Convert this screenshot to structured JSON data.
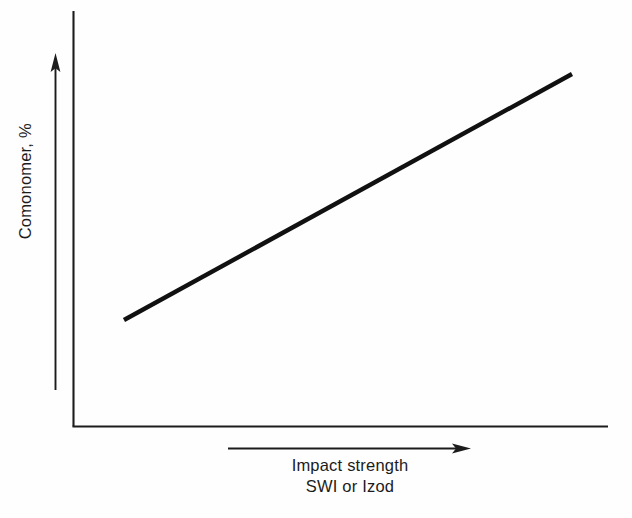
{
  "figure": {
    "background_color": "#fefefe",
    "ink_color": "#1c1c1c",
    "data_line_color": "#111111"
  },
  "axes": {
    "y_axis": {
      "label": "Comonomer, %",
      "arrow_direction": "up",
      "arrow_name": "y-axis-direction-arrow"
    },
    "x_axis": {
      "label_line1": "Impact strength",
      "label_line2": "SWI or Izod",
      "arrow_direction": "right",
      "arrow_name": "x-axis-direction-arrow"
    }
  },
  "chart_data": {
    "type": "line",
    "title": "",
    "subtitle": "",
    "xlabel": "Impact strength SWI or Izod",
    "ylabel": "Comonomer, %",
    "grid": false,
    "legend": null,
    "axis_ticks": {
      "x": [],
      "y": []
    },
    "xlim": [
      0,
      1
    ],
    "ylim": [
      0,
      1
    ],
    "annotations": [
      "Comonomer, %",
      "Impact strength",
      "SWI or Izod"
    ],
    "series": [
      {
        "name": "Comonomer vs impact strength",
        "style": "solid",
        "linewidth_px": 4,
        "color": "#111111",
        "x": [
          0.095,
          1.0
        ],
        "y": [
          0.255,
          0.848
        ],
        "points_px": [
          {
            "x": 124,
            "y": 320
          },
          {
            "x": 572,
            "y": 74
          }
        ],
        "description": "Single straight increasing line: comonomer percentage rises linearly with impact strength"
      }
    ]
  }
}
